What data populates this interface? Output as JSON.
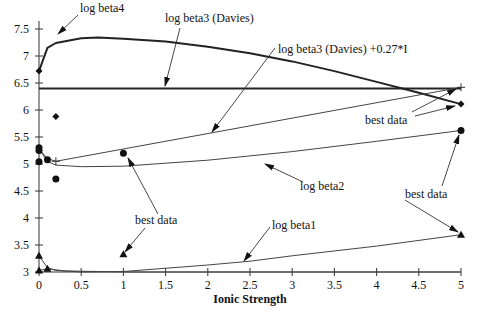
{
  "chart_data": {
    "type": "line",
    "title": "",
    "xlabel": "Ionic Strength",
    "ylabel": "",
    "xlim": [
      0,
      5
    ],
    "ylim": [
      3,
      7.5
    ],
    "x_ticks": [
      "0",
      "0.5",
      "1",
      "1.5",
      "2",
      "2.5",
      "3",
      "3.5",
      "4",
      "4.5",
      "5"
    ],
    "y_ticks": [
      "3",
      "3.5",
      "4",
      "4.5",
      "5",
      "5.5",
      "6",
      "6.5",
      "7",
      "7.5"
    ],
    "grid": false,
    "series": [
      {
        "name": "log beta4",
        "style": "thick-line",
        "x": [
          0,
          0.1,
          0.2,
          0.5,
          0.7,
          1,
          1.5,
          2,
          2.5,
          3,
          3.5,
          4,
          4.5,
          5
        ],
        "y": [
          6.72,
          7.15,
          7.24,
          7.33,
          7.34,
          7.32,
          7.27,
          7.17,
          7.05,
          6.9,
          6.72,
          6.52,
          6.32,
          6.11
        ]
      },
      {
        "name": "log beta3 (Davies)",
        "style": "thick-line",
        "x": [
          0,
          5
        ],
        "y": [
          6.4,
          6.4
        ]
      },
      {
        "name": "log beta3 (Davies) +0.27*I",
        "style": "thin-line",
        "x": [
          0,
          0.1,
          0.2,
          5
        ],
        "y": [
          5.28,
          5.1,
          5.05,
          6.42
        ]
      },
      {
        "name": "log beta2",
        "style": "thin-line",
        "x": [
          0,
          0.1,
          0.2,
          0.5,
          1,
          2,
          3,
          4,
          5
        ],
        "y": [
          5.28,
          5.05,
          4.98,
          4.95,
          4.96,
          5.07,
          5.23,
          5.42,
          5.62
        ]
      },
      {
        "name": "log beta1",
        "style": "thin-line",
        "x": [
          0,
          0.1,
          0.2,
          0.5,
          1,
          2,
          2.5,
          3,
          4,
          5
        ],
        "y": [
          3.3,
          3.08,
          3.03,
          3.0,
          3.01,
          3.13,
          3.2,
          3.3,
          3.48,
          3.69
        ]
      },
      {
        "name": "log beta1 (lower)",
        "style": "thin-line",
        "x": [
          0,
          0.1,
          0.3,
          1,
          5
        ],
        "y": [
          3.03,
          3.06,
          3.02,
          3.0,
          3.0
        ]
      }
    ],
    "markers": [
      {
        "shape": "diamond",
        "x": 0,
        "y": 6.72
      },
      {
        "shape": "diamond",
        "x": 0.2,
        "y": 5.88
      },
      {
        "shape": "diamond",
        "x": 5,
        "y": 6.11
      },
      {
        "shape": "plus",
        "x": 0.2,
        "y": 5.05
      },
      {
        "shape": "plus",
        "x": 5,
        "y": 6.42
      },
      {
        "shape": "circle",
        "x": 0,
        "y": 5.3
      },
      {
        "shape": "circle",
        "x": 0,
        "y": 5.25
      },
      {
        "shape": "circle",
        "x": 0,
        "y": 5.04
      },
      {
        "shape": "circle",
        "x": 0.1,
        "y": 5.08
      },
      {
        "shape": "circle",
        "x": 0.2,
        "y": 4.72
      },
      {
        "shape": "circle",
        "x": 1,
        "y": 5.2
      },
      {
        "shape": "circle",
        "x": 5,
        "y": 5.62
      },
      {
        "shape": "triangle",
        "x": 0,
        "y": 3.3
      },
      {
        "shape": "triangle",
        "x": 0,
        "y": 3.03
      },
      {
        "shape": "triangle",
        "x": 0.1,
        "y": 3.06
      },
      {
        "shape": "triangle",
        "x": 1,
        "y": 3.33
      },
      {
        "shape": "triangle",
        "x": 5,
        "y": 3.69
      }
    ],
    "annotations": [
      {
        "text": "log beta4",
        "tx": 80,
        "ty": 12,
        "ax1": 78,
        "ay1": 15,
        "ax2": 58,
        "ay2": 34
      },
      {
        "text": "log beta3 (Davies)",
        "tx": 165,
        "ty": 22,
        "ax1": 180,
        "ay1": 28,
        "ax2": 165,
        "ay2": 86
      },
      {
        "text": "log beta3 (Davies) +0.27*I",
        "tx": 278,
        "ty": 53,
        "ax1": 275,
        "ay1": 48,
        "ax2": 212,
        "ay2": 132
      },
      {
        "text": "log beta2",
        "tx": 300,
        "ty": 190,
        "ax1": 303,
        "ay1": 182,
        "ax2": 265,
        "ay2": 164
      },
      {
        "text": "log beta1",
        "tx": 272,
        "ty": 229,
        "ax1": 270,
        "ay1": 227,
        "ax2": 244,
        "ay2": 261
      },
      {
        "text": "best data",
        "tx": 365,
        "ty": 124
      },
      {
        "text": "best data",
        "tx": 405,
        "ty": 198
      },
      {
        "text": "best data",
        "tx": 135,
        "ty": 224
      }
    ],
    "legend_position": "none"
  }
}
